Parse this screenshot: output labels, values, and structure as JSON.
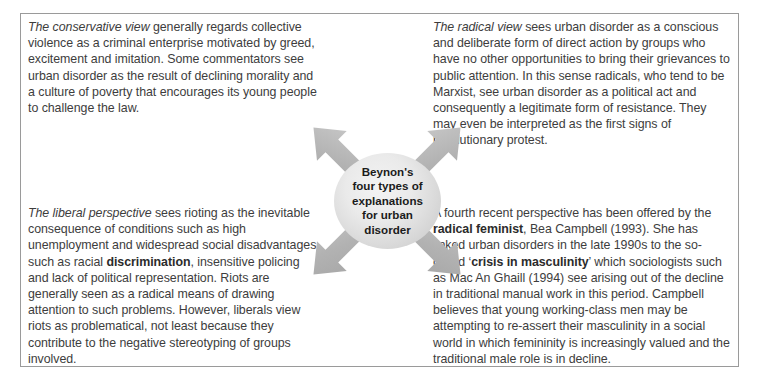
{
  "diagram": {
    "center": {
      "label": "Beynon's four types of explanations for urban disorder",
      "lines": [
        "Beynon's",
        "four types of",
        "explanations",
        "for urban",
        "disorder"
      ]
    },
    "arrows": [
      {
        "name": "arrow-to-conservative",
        "direction": "up-left"
      },
      {
        "name": "arrow-to-radical",
        "direction": "up-right"
      },
      {
        "name": "arrow-to-liberal",
        "direction": "down-left"
      },
      {
        "name": "arrow-to-feminist",
        "direction": "down-right"
      }
    ],
    "colors": {
      "arrow_fill": "#b0b0b0",
      "circle_light": "#f3f3f3",
      "circle_dark": "#c2c2c2",
      "frame_border": "#9a9a9a",
      "body_text": "#3d3d3d"
    },
    "quadrants": {
      "top_left": {
        "name": "conservative-view",
        "lead_italic": "The conservative view",
        "body": " generally regards collective violence as a criminal enterprise motivated by greed, excitement and imitation. Some commentators see urban disorder as the result of declining morality and a culture of poverty that encourages its young people to challenge the law."
      },
      "top_right": {
        "name": "radical-view",
        "lead_italic": "The radical view",
        "body": " sees urban disorder as a conscious and deliberate form of direct action by groups who have no other opportunities to bring their grievances to public attention. In this sense radicals, who tend to be Marxist, see urban disorder as a political act and consequently a legitimate form of resistance. They may even be interpreted as the first signs of revolutionary protest."
      },
      "bottom_left": {
        "name": "liberal-perspective",
        "lead_italic": "The liberal perspective",
        "body_part1": " sees rioting as the inevitable consequence of conditions such as high unemployment and widespread social disadvantages such as racial ",
        "bold_term": "discrimination",
        "body_part2": ", insensitive policing and lack of political representation. Riots are generally seen as a radical means of drawing attention to such problems. However, liberals view riots as problematical, not least because they contribute to the negative stereotyping of groups involved."
      },
      "bottom_right": {
        "name": "radical-feminist-view",
        "body_part1": "A fourth recent perspective has been offered by the ",
        "bold_term1": "radical feminist",
        "body_part2": ", Bea Campbell (1993). She has linked urban disorders in the late 1990s to the so-called ‘",
        "bold_term2": "crisis in masculinity",
        "body_part3": "’ which sociologists such as Mac An Ghaill (1994) see arising out of the decline in traditional manual work in this period. Campbell believes that young working-class men may be attempting to re-assert their masculinity in a social world in which femininity is increasingly valued and the traditional male role is in decline."
      }
    }
  }
}
